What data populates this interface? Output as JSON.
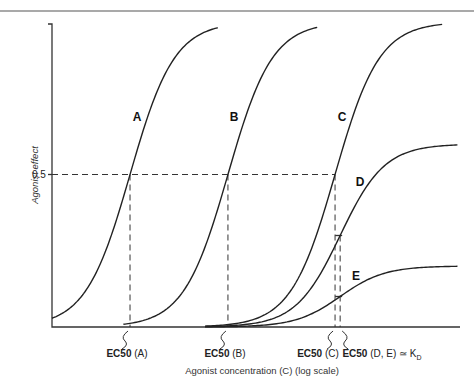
{
  "chart_data": {
    "type": "line",
    "title": "",
    "xlabel": "Agonist concentration (C) (log scale)",
    "ylabel": "Agonist effect",
    "xscale": "log",
    "x_domain_log10": [
      0,
      8
    ],
    "ylim": [
      0,
      1
    ],
    "y_ticks": [
      {
        "value": 0.5,
        "label": "0.5"
      }
    ],
    "grid": false,
    "legend": "none (curves labeled directly)",
    "series": [
      {
        "name": "A",
        "ec50_log10": 1.53,
        "emax": 1.0,
        "hill": 1.0,
        "x_range_log10": [
          0.0,
          3.25
        ]
      },
      {
        "name": "B",
        "ec50_log10": 3.45,
        "emax": 1.0,
        "hill": 1.0,
        "x_range_log10": [
          1.4,
          5.2
        ]
      },
      {
        "name": "C",
        "ec50_log10": 5.55,
        "emax": 1.0,
        "hill": 1.0,
        "x_range_log10": [
          3.0,
          7.65
        ]
      },
      {
        "name": "D",
        "ec50_log10": 5.65,
        "emax": 0.6,
        "hill": 1.0,
        "x_range_log10": [
          3.0,
          7.95
        ]
      },
      {
        "name": "E",
        "ec50_log10": 5.65,
        "emax": 0.2,
        "hill": 1.0,
        "x_range_log10": [
          3.0,
          7.95
        ]
      }
    ],
    "reference_lines": [
      {
        "type": "horizontal",
        "y": 0.5,
        "style": "dashed",
        "to_x_log10": 5.55
      },
      {
        "type": "vertical",
        "x_log10": 1.53,
        "style": "dashed"
      },
      {
        "type": "vertical",
        "x_log10": 3.45,
        "style": "dashed"
      },
      {
        "type": "vertical",
        "x_log10": 5.55,
        "style": "dashed"
      },
      {
        "type": "vertical",
        "x_log10": 5.65,
        "style": "dashed"
      }
    ],
    "annotations": [
      {
        "target": "A",
        "text_bold": "EC50",
        "text": " (A)",
        "x_log10": 1.53
      },
      {
        "target": "B",
        "text_bold": "EC50",
        "text": " (B)",
        "x_log10": 3.45
      },
      {
        "target": "C",
        "text_bold": "EC50",
        "text": " (C)",
        "x_log10": 5.55
      },
      {
        "target": "D,E",
        "text_bold": "EC50",
        "text": " (D, E) ≃ K",
        "subscript": "D",
        "x_log10": 5.65
      }
    ]
  }
}
